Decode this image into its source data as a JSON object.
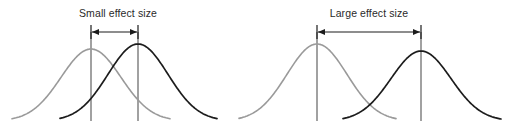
{
  "figure": {
    "background_color": "#ffffff",
    "width": 511,
    "height": 131
  },
  "colors": {
    "control_curve": "#9a9a9a",
    "treatment_curve": "#1c1c1c",
    "mean_line": "#6f6f6f",
    "arrow": "#1c1c1c",
    "label_text": "#2a2a2a"
  },
  "panels": [
    {
      "id": "small-effect",
      "title": "Small effect size",
      "title_x": 118,
      "title_y": 17,
      "arrow_y": 32,
      "arrow_x1": 91,
      "arrow_x2": 138,
      "cap_top": 25,
      "cap_bottom": 39,
      "curves": [
        {
          "name": "control",
          "style": "control",
          "mean_x": 91,
          "peak_y": 49,
          "sigma": 30,
          "start_x": 12,
          "end_x": 170
        },
        {
          "name": "treatment",
          "style": "treatment",
          "mean_x": 138,
          "peak_y": 44,
          "sigma": 30,
          "start_x": 60,
          "end_x": 217
        }
      ],
      "mean_lines": [
        {
          "x": 91,
          "y_top": 32,
          "y_bottom": 121
        },
        {
          "x": 138,
          "y_top": 32,
          "y_bottom": 121
        }
      ]
    },
    {
      "id": "large-effect",
      "title": "Large effect size",
      "title_x": 369,
      "title_y": 17,
      "arrow_y": 32,
      "arrow_x1": 317,
      "arrow_x2": 421,
      "cap_top": 25,
      "cap_bottom": 39,
      "curves": [
        {
          "name": "control",
          "style": "control",
          "mean_x": 317,
          "peak_y": 44,
          "sigma": 30,
          "start_x": 239,
          "end_x": 396
        },
        {
          "name": "treatment",
          "style": "treatment",
          "mean_x": 421,
          "peak_y": 51,
          "sigma": 30,
          "start_x": 343,
          "end_x": 501
        }
      ],
      "mean_lines": [
        {
          "x": 317,
          "y_top": 32,
          "y_bottom": 121
        },
        {
          "x": 421,
          "y_top": 32,
          "y_bottom": 121
        }
      ]
    }
  ],
  "chart_data": {
    "type": "line",
    "title": "",
    "xlabel": "",
    "ylabel": "",
    "grid": false,
    "legend_position": "none",
    "annotations": [
      "Small effect size",
      "Large effect size"
    ],
    "baseline_y": 121,
    "series": [
      {
        "panel": "Small effect size",
        "name": "control",
        "color": "#9a9a9a",
        "distribution": "normal",
        "mean_x_px": 91,
        "sigma_px": 30,
        "peak_y_px": 49
      },
      {
        "panel": "Small effect size",
        "name": "treatment",
        "color": "#1c1c1c",
        "distribution": "normal",
        "mean_x_px": 138,
        "sigma_px": 30,
        "peak_y_px": 44
      },
      {
        "panel": "Large effect size",
        "name": "control",
        "color": "#9a9a9a",
        "distribution": "normal",
        "mean_x_px": 317,
        "sigma_px": 30,
        "peak_y_px": 44
      },
      {
        "panel": "Large effect size",
        "name": "treatment",
        "color": "#1c1c1c",
        "distribution": "normal",
        "mean_x_px": 421,
        "sigma_px": 30,
        "peak_y_px": 51
      }
    ],
    "effect_sizes": [
      {
        "label": "Small effect size",
        "mean_separation_px": 47,
        "separation_in_sigma": 1.57
      },
      {
        "label": "Large effect size",
        "mean_separation_px": 104,
        "separation_in_sigma": 3.47
      }
    ]
  }
}
